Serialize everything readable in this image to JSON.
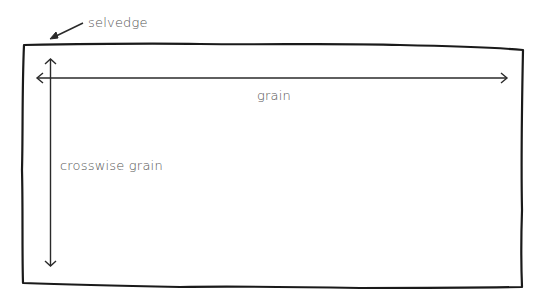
{
  "diagram": {
    "labels": {
      "selvedge": "selvedge",
      "grain": "grain",
      "crosswise_grain": "crosswise grain"
    },
    "colors": {
      "stroke": "#1a1a1a",
      "text": "#555555",
      "background": "#ffffff"
    },
    "elements": [
      {
        "id": "fabric-rectangle",
        "type": "hand-drawn rectangle"
      },
      {
        "id": "grain-arrow",
        "type": "double-headed arrow",
        "orientation": "horizontal",
        "label": "grain"
      },
      {
        "id": "crosswise-grain-arrow",
        "type": "double-headed arrow",
        "orientation": "vertical",
        "label": "crosswise grain"
      },
      {
        "id": "selvedge-pointer",
        "type": "single-headed arrow",
        "points_to": "top-left edge of fabric",
        "label": "selvedge"
      }
    ]
  }
}
